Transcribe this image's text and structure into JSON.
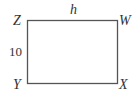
{
  "diagram": {
    "shape": "rectangle",
    "vertices": {
      "top_left": "Z",
      "top_right": "W",
      "bottom_right": "X",
      "bottom_left": "Y"
    },
    "side_labels": {
      "top": "h",
      "left": "10"
    },
    "stroke_color": "#555555"
  }
}
